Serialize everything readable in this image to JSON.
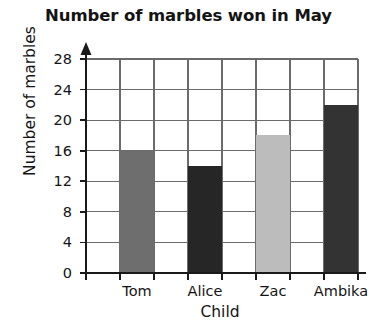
{
  "chart_data": {
    "type": "bar",
    "title": "Number of marbles won in May",
    "xlabel": "Child",
    "ylabel": "Number of marbles",
    "categories": [
      "Tom",
      "Alice",
      "Zac",
      "Ambika"
    ],
    "values": [
      16,
      14,
      18,
      22
    ],
    "bar_colors": [
      "#6e6e6e",
      "#262626",
      "#bcbcbc",
      "#333333"
    ],
    "ylim": [
      0,
      28
    ],
    "y_ticks": [
      0,
      4,
      8,
      12,
      16,
      20,
      24,
      28
    ],
    "y_tick_labels": [
      "0",
      "4",
      "8",
      "12",
      "16",
      "20",
      "24",
      "28"
    ],
    "grid": true,
    "legend": false,
    "axis_color": "#1a1a1a",
    "grid_color": "#6b6b6b",
    "y_axis_arrow": true
  }
}
